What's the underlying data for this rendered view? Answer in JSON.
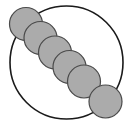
{
  "figure": {
    "canvas": {
      "width": 134,
      "height": 127,
      "background": "#ffffff"
    },
    "colors": {
      "background": "#ffffff",
      "circle_fill": "#ababab",
      "circle_stroke": "#4a4a4a",
      "outline_stroke": "#1a1a1a"
    },
    "outline_circle": {
      "label": "large-outline-circle",
      "cx": 66.5,
      "cy": 62.5,
      "r": 56.5,
      "fill": "none",
      "stroke": "#1a1a1a",
      "stroke_width": 1.6
    },
    "small_circles": {
      "count": 6,
      "radius": 16.5,
      "fill": "#ababab",
      "stroke": "#4a4a4a",
      "stroke_width": 1.2,
      "items": [
        {
          "label": "circle-1",
          "cx": 26.0,
          "cy": 24.0
        },
        {
          "label": "circle-2",
          "cx": 40.5,
          "cy": 38.0
        },
        {
          "label": "circle-3",
          "cx": 55.0,
          "cy": 52.5
        },
        {
          "label": "circle-4",
          "cx": 69.5,
          "cy": 67.0
        },
        {
          "label": "circle-5",
          "cx": 84.0,
          "cy": 81.5
        },
        {
          "label": "circle-6",
          "cx": 105.5,
          "cy": 101.5
        }
      ]
    }
  }
}
